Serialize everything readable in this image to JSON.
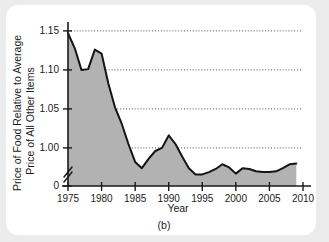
{
  "figure": {
    "caption": "(b)",
    "background_color": "#ffffff",
    "page_background_color": "#ececec"
  },
  "chart_data": {
    "type": "area",
    "title": "",
    "subtitle": "",
    "xlabel": "Year",
    "ylabel_line1": "Price of Food Relative to Average",
    "ylabel_line2": "Price of All Other Items",
    "legend": [],
    "legend_position": "none",
    "grid": true,
    "grid_style": "dotted-horizontal",
    "axis_break": true,
    "axis_break_between": [
      0,
      0.955
    ],
    "xlim": [
      1975,
      2010
    ],
    "ylim": [
      0.955,
      1.155
    ],
    "xticks": [
      1975,
      1980,
      1985,
      1990,
      1995,
      2000,
      2005,
      2010
    ],
    "xtick_labels": [
      "1975",
      "1980",
      "1985",
      "1990",
      "1995",
      "2000",
      "2005",
      "2010"
    ],
    "yticks": [
      0,
      1.0,
      1.05,
      1.1,
      1.15
    ],
    "ytick_labels": [
      "0",
      "1.00",
      "1.05",
      "1.10",
      "1.15"
    ],
    "gridline_values": [
      1.0,
      1.05,
      1.1,
      1.15
    ],
    "series_name": "Price of food relative to average price of all other items",
    "area_color": "#b2b2b2",
    "line_color": "#151515",
    "x": [
      1975,
      1976,
      1977,
      1978,
      1979,
      1980,
      1981,
      1982,
      1983,
      1984,
      1985,
      1986,
      1987,
      1988,
      1989,
      1990,
      1991,
      1992,
      1993,
      1994,
      1995,
      1996,
      1997,
      1998,
      1999,
      2000,
      2001,
      2002,
      2003,
      2004,
      2005,
      2006,
      2007,
      2008,
      2009
    ],
    "values": [
      1.147,
      1.128,
      1.1,
      1.101,
      1.126,
      1.121,
      1.083,
      1.052,
      1.031,
      1.005,
      0.982,
      0.974,
      0.986,
      0.996,
      1.0,
      1.016,
      1.005,
      0.989,
      0.974,
      0.966,
      0.966,
      0.969,
      0.973,
      0.979,
      0.975,
      0.967,
      0.974,
      0.973,
      0.97,
      0.969,
      0.969,
      0.97,
      0.974,
      0.979,
      0.98
    ]
  }
}
